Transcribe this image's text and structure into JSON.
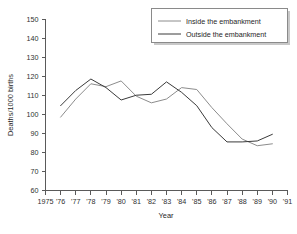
{
  "chart_data": {
    "type": "line",
    "title": "",
    "xlabel": "Year",
    "ylabel": "Deaths/1000 births",
    "xlim": [
      1975,
      1991
    ],
    "ylim": [
      60,
      150
    ],
    "ytick_step": 10,
    "grid": false,
    "legend_position": "top-right",
    "x": [
      1976,
      1977,
      1978,
      1979,
      1980,
      1981,
      1982,
      1983,
      1984,
      1985,
      1986,
      1987,
      1988,
      1989,
      1990
    ],
    "xticklabels": [
      "1975",
      "'76",
      "'77",
      "'78",
      "'79",
      "'80",
      "'81",
      "'82",
      "'83",
      "'84",
      "'85",
      "'86",
      "'87",
      "'88",
      "'89",
      "'90",
      "'91"
    ],
    "xtickvalues": [
      1975,
      1976,
      1977,
      1978,
      1979,
      1980,
      1981,
      1982,
      1983,
      1984,
      1985,
      1986,
      1987,
      1988,
      1989,
      1990,
      1991
    ],
    "yticklabels": [
      "60",
      "70",
      "80",
      "90",
      "100",
      "110",
      "120",
      "130",
      "140",
      "150"
    ],
    "ytickvalues": [
      60,
      70,
      80,
      90,
      100,
      110,
      120,
      130,
      140,
      150
    ],
    "series": [
      {
        "name": "Inside the embankment",
        "color": "#8c8c8c",
        "values": [
          98.5,
          108.0,
          116.0,
          114.5,
          117.5,
          109.5,
          106.0,
          108.0,
          114.0,
          113.0,
          103.5,
          95.0,
          87.0,
          83.5,
          84.5
        ]
      },
      {
        "name": "Outside the embankment",
        "color": "#3a3a3a",
        "values": [
          104.5,
          112.5,
          118.5,
          114.0,
          107.5,
          110.0,
          110.5,
          117.0,
          111.5,
          104.5,
          93.0,
          85.5,
          85.5,
          86.0,
          89.5
        ]
      }
    ]
  },
  "legend": {
    "entries": [
      {
        "label": "Inside the embankment",
        "color": "#8c8c8c"
      },
      {
        "label": "Outside the embankment",
        "color": "#3a3a3a"
      }
    ]
  }
}
